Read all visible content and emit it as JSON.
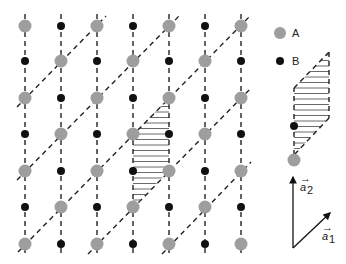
{
  "figure": {
    "type": "lattice-diagram",
    "colors": {
      "atom_A": "#9e9e9e",
      "atom_B": "#111111",
      "lines": "#222222",
      "hatch": "#444444",
      "background": "#ffffff"
    },
    "lattice": {
      "columns_x": [
        25,
        61,
        97,
        133,
        169,
        205,
        241
      ],
      "rows_y": [
        26,
        61,
        98,
        134,
        171,
        207,
        244
      ],
      "vertical_line_range": [
        14,
        256
      ],
      "rule": "A where (col+row) is even, B otherwise"
    },
    "diagonals": [
      {
        "x1": 17,
        "y1": 107,
        "x2": 106,
        "y2": 16
      },
      {
        "x1": 17,
        "y1": 180,
        "x2": 180,
        "y2": 15
      },
      {
        "x1": 18,
        "y1": 252,
        "x2": 250,
        "y2": 16
      },
      {
        "x1": 88,
        "y1": 254,
        "x2": 251,
        "y2": 88
      },
      {
        "x1": 162,
        "y1": 254,
        "x2": 251,
        "y2": 162
      }
    ],
    "unit_cell_main": {
      "points": [
        [
          133,
          134
        ],
        [
          169,
          98
        ],
        [
          169,
          171
        ],
        [
          133,
          207
        ]
      ]
    }
  },
  "legend": {
    "items": [
      {
        "label": "A",
        "kind": "atom_A"
      },
      {
        "label": "B",
        "kind": "atom_B"
      }
    ]
  },
  "inset_cell": {
    "points": [
      [
        294,
        88
      ],
      [
        329,
        52
      ],
      [
        329,
        118
      ],
      [
        294,
        155
      ]
    ],
    "atom_B": [
      294,
      126
    ],
    "atom_A": [
      294,
      160
    ]
  },
  "vectors": {
    "origin": [
      293,
      248
    ],
    "a1": {
      "label": "a",
      "subscript": "1",
      "tip": [
        330,
        213
      ]
    },
    "a2": {
      "label": "a",
      "subscript": "2",
      "tip": [
        293,
        177
      ]
    }
  }
}
